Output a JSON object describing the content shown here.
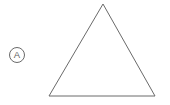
{
  "figure": {
    "background_color": "#ffffff",
    "stroke_color": "#6a6a6a",
    "stroke_width": 1,
    "width": 170,
    "height": 105
  },
  "label": {
    "text": "A",
    "shape": "circle",
    "center_x": 17,
    "center_y": 55,
    "radius": 7.5,
    "text_color": "#5f5f5f",
    "circle_color": "#6a6a6a"
  },
  "shape": {
    "name": "triangle",
    "type": "triangle",
    "fill": "none",
    "points": "103,4 155,96 49,96",
    "vertices": [
      {
        "name": "apex",
        "x": 103,
        "y": 4
      },
      {
        "name": "bottom-right",
        "x": 155,
        "y": 96
      },
      {
        "name": "bottom-left",
        "x": 49,
        "y": 96
      }
    ]
  }
}
